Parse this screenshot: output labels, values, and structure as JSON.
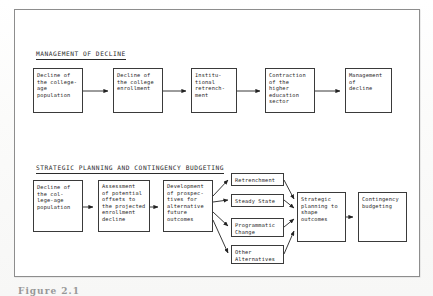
{
  "figure": {
    "caption": "Figure 2.1",
    "frame_color": "#8d8d8d",
    "box_border_color": "#3a3a3a",
    "text_color": "#1d1d1d"
  },
  "sections": [
    {
      "id": "management-of-decline",
      "heading": "MANAGEMENT OF DECLINE",
      "boxes": [
        {
          "id": "decline-college-age-population",
          "text": "Decline of\nthe college-\nage\npopulation"
        },
        {
          "id": "decline-college-enrollment",
          "text": "Decline of\nthe college\nenrollment"
        },
        {
          "id": "institutional-retrenchment",
          "text": "Institu-\ntional\nretrench-\nment"
        },
        {
          "id": "contraction-higher-education",
          "text": "Contraction\nof the\nhigher\neducation\nsector"
        },
        {
          "id": "management-of-decline",
          "text": "Management\nof\ndecline"
        }
      ]
    },
    {
      "id": "strategic-planning-and-contingency-budgeting",
      "heading": "STRATEGIC PLANNING AND CONTINGENCY BUDGETING",
      "boxes": [
        {
          "id": "decline-college-age-population-2",
          "text": "Decline of\nthe col-\nlege-age\npopulation"
        },
        {
          "id": "assessment-of-potential-offsets",
          "text": "Assessment\nof potential\noffsets to\nthe projected\nenrollment\ndecline"
        },
        {
          "id": "development-of-prospectives",
          "text": "Development\nof prospec-\ntives for\nalternative\nfuture\noutcomes"
        },
        {
          "id": "retrenchment",
          "text": "Retrenchment"
        },
        {
          "id": "steady-state",
          "text": "Steady State"
        },
        {
          "id": "programmatic-change",
          "text": "Programmatic\nChange"
        },
        {
          "id": "other-alternatives",
          "text": "Other\nAlternatives"
        },
        {
          "id": "strategic-planning-shape-outcomes",
          "text": "Strategic\nplanning to\nshape\noutcomes"
        },
        {
          "id": "contingency-budgeting",
          "text": "Contingency\nbudgeting"
        }
      ]
    }
  ]
}
